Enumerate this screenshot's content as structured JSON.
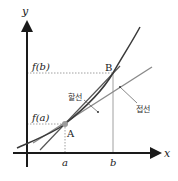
{
  "diagram": {
    "axes": {
      "x_label": "x",
      "y_label": "y"
    },
    "points": {
      "A": {
        "label": "A",
        "x_tick": "a",
        "y_tick": "f(a)"
      },
      "B": {
        "label": "B",
        "x_tick": "b",
        "y_tick": "f(b)"
      }
    },
    "lines": {
      "secant": {
        "label": "할선"
      },
      "tangent": {
        "label": "접선"
      }
    },
    "colors": {
      "axis": "#1a1a1a",
      "curve": "#3a3a3a",
      "secant": "#555555",
      "tangent": "#8a8a8a",
      "guides": "#888888",
      "point_fill": "#9a9a9a"
    }
  }
}
